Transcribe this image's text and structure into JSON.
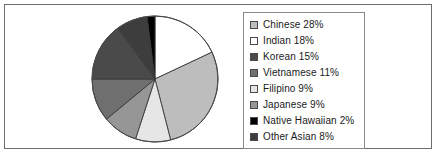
{
  "figure": {
    "background_color": "#ffffff",
    "frame_border_color": "#6d6d6d",
    "legend_border_color": "#8a8a8a",
    "swatch_border_color": "#4a4a4a"
  },
  "legend": {
    "position": "right",
    "items": [
      {
        "label": "Chinese 28%",
        "swatch_name": "legend-swatch-chinese",
        "color": "#bdbdbd"
      },
      {
        "label": "Indian 18%",
        "swatch_name": "legend-swatch-indian",
        "color": "#ffffff"
      },
      {
        "label": "Korean 15%",
        "swatch_name": "legend-swatch-korean",
        "color": "#4a4a4a"
      },
      {
        "label": "Vietnamese 11%",
        "swatch_name": "legend-swatch-vietnamese",
        "color": "#6f6f6f"
      },
      {
        "label": "Filipino 9%",
        "swatch_name": "legend-swatch-filipino",
        "color": "#e6e6e6"
      },
      {
        "label": "Japanese 9%",
        "swatch_name": "legend-swatch-japanese",
        "color": "#969696"
      },
      {
        "label": "Native Hawaiian 2%",
        "swatch_name": "legend-swatch-native-hawaiian",
        "color": "#000000"
      },
      {
        "label": "Other Asian 8%",
        "swatch_name": "legend-swatch-other-asian",
        "color": "#3d3d3d"
      }
    ]
  },
  "chart_data": {
    "type": "pie",
    "title": "",
    "xlabel": "",
    "ylabel": "",
    "start_angle_deg": 0,
    "direction": "clockwise",
    "grid": false,
    "legend_position": "right",
    "labels": [
      "Chinese",
      "Indian",
      "Korean",
      "Vietnamese",
      "Filipino",
      "Japanese",
      "Native Hawaiian",
      "Other Asian"
    ],
    "values": [
      28,
      18,
      15,
      11,
      9,
      9,
      2,
      8
    ],
    "value_labels": [
      "28%",
      "18%",
      "15%",
      "11%",
      "9%",
      "9%",
      "2%",
      "8%"
    ],
    "colors": [
      "#bdbdbd",
      "#ffffff",
      "#4a4a4a",
      "#6f6f6f",
      "#e6e6e6",
      "#969696",
      "#000000",
      "#3d3d3d"
    ],
    "slice_order_clockwise_from_top": [
      {
        "label": "Indian",
        "value": 18,
        "color": "#ffffff"
      },
      {
        "label": "Chinese",
        "value": 28,
        "color": "#bdbdbd"
      },
      {
        "label": "Filipino",
        "value": 9,
        "color": "#e6e6e6"
      },
      {
        "label": "Japanese",
        "value": 9,
        "color": "#969696"
      },
      {
        "label": "Vietnamese",
        "value": 11,
        "color": "#6f6f6f"
      },
      {
        "label": "Korean",
        "value": 15,
        "color": "#4a4a4a"
      },
      {
        "label": "Other Asian",
        "value": 8,
        "color": "#3d3d3d"
      },
      {
        "label": "Native Hawaiian",
        "value": 2,
        "color": "#000000"
      }
    ],
    "total_percent": 100
  }
}
